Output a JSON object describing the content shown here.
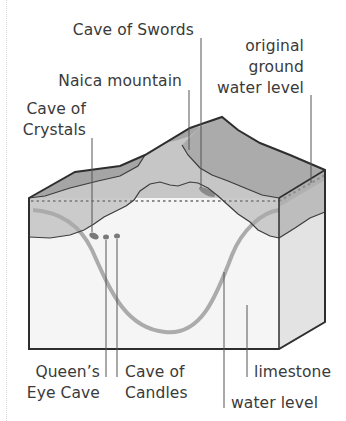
{
  "diagram": {
    "type": "geological block diagram",
    "labels": {
      "cave_of_swords": "Cave of Swords",
      "naica_mountain": "Naica mountain",
      "cave_of_crystals_l1": "Cave of",
      "cave_of_crystals_l2": "Crystals",
      "original_gw_l1": "original",
      "original_gw_l2": "ground",
      "original_gw_l3": "water level",
      "queens_eye_l1": "Queen’s",
      "queens_eye_l2": "Eye Cave",
      "cave_of_candles_l1": "Cave of",
      "cave_of_candles_l2": "Candles",
      "limestone": "limestone",
      "water_level": "water level"
    },
    "colors": {
      "outline": "#2e2e2e",
      "upper_layer": "#a9a9a9",
      "middle_layer": "#c9c9c9",
      "limestone_front": "#f4f4f4",
      "limestone_side": "#e2e2e2",
      "water_curve": "#a8a8a8",
      "dotted_line": "#8a8a8a",
      "leader": "#555555",
      "text": "#3a3a3a"
    }
  }
}
